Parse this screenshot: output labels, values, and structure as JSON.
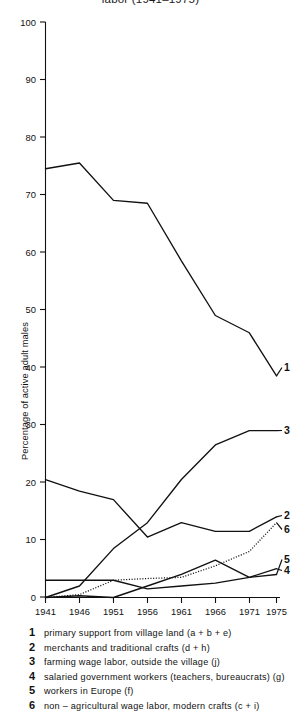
{
  "title": "labor  (1941–1975)",
  "axis": {
    "y_title": "Percentage of active adult males",
    "y_ticks": [
      "0",
      "10",
      "20",
      "30",
      "40",
      "50",
      "60",
      "70",
      "80",
      "90",
      "100"
    ],
    "x_ticks": [
      "1941",
      "1946",
      "1951",
      "1956",
      "1961",
      "1966",
      "1971",
      "1975"
    ]
  },
  "series_labels": {
    "s1": "1",
    "s2": "2",
    "s3": "3",
    "s4": "4",
    "s5": "5",
    "s6": "6"
  },
  "legend": [
    {
      "key": "1",
      "text": "primary support from village land  (a + b + e)"
    },
    {
      "key": "2",
      "text": "merchants and traditional crafts  (d + h)"
    },
    {
      "key": "3",
      "text": "farming wage labor, outside the village  (j)"
    },
    {
      "key": "4",
      "text": "salaried government workers (teachers, bureaucrats) (g)"
    },
    {
      "key": "5",
      "text": "workers in Europe  (f)"
    },
    {
      "key": "6",
      "text": "non – agricultural wage labor,  modern crafts  (c + i)"
    }
  ],
  "colors": {
    "ink": "#111111",
    "background": "#ffffff"
  },
  "chart_data": {
    "type": "line",
    "title": "labor  (1941–1975)",
    "xlabel": "",
    "ylabel": "Percentage of active adult males",
    "xlim": [
      1941,
      1975
    ],
    "ylim": [
      0,
      100
    ],
    "grid": false,
    "legend_position": "below",
    "x": [
      1941,
      1946,
      1951,
      1956,
      1961,
      1966,
      1971,
      1975
    ],
    "series": [
      {
        "name": "1",
        "label": "primary support from village land (a + b + e)",
        "style": "solid",
        "values": [
          74.5,
          75.5,
          69.0,
          68.5,
          58.5,
          49.0,
          46.0,
          38.5
        ]
      },
      {
        "name": "2",
        "label": "merchants and traditional crafts (d + h)",
        "style": "solid",
        "values": [
          20.5,
          18.5,
          17.0,
          10.5,
          13.0,
          11.5,
          11.5,
          14.0
        ]
      },
      {
        "name": "3",
        "label": "farming wage labor, outside the village (j)",
        "style": "solid",
        "values": [
          0.0,
          2.0,
          8.5,
          13.0,
          20.5,
          26.5,
          29.0,
          29.0
        ]
      },
      {
        "name": "4",
        "label": "salaried government workers (teachers, bureaucrats) (g)",
        "style": "solid",
        "values": [
          3.0,
          3.0,
          3.0,
          1.5,
          2.0,
          2.5,
          3.5,
          5.0
        ]
      },
      {
        "name": "5",
        "label": "workers in Europe (f)",
        "style": "solid",
        "values": [
          0.0,
          0.3,
          0.0,
          2.0,
          4.0,
          6.5,
          3.5,
          4.0
        ]
      },
      {
        "name": "6",
        "label": "non – agricultural wage labor, modern crafts (c + i)",
        "style": "dotted",
        "values": [
          0.0,
          0.5,
          3.0,
          3.3,
          3.5,
          5.5,
          8.0,
          13.0
        ]
      }
    ]
  }
}
